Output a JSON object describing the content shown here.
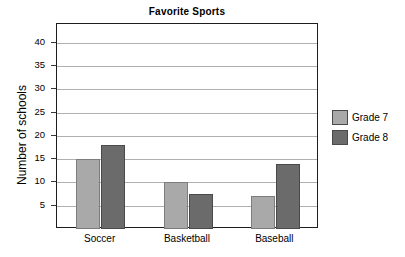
{
  "chart_data": {
    "type": "bar",
    "title": "Favorite Sports",
    "xlabel": "",
    "ylabel": "Number of schools",
    "categories": [
      "Soccer",
      "Basketball",
      "Baseball"
    ],
    "series": [
      {
        "name": "Grade 7",
        "color": "#a9a9a9",
        "values": [
          15,
          10,
          7
        ]
      },
      {
        "name": "Grade 8",
        "color": "#6b6b6b",
        "values": [
          18,
          7.5,
          14
        ]
      }
    ],
    "ylim": [
      0,
      44
    ],
    "yticks": [
      5,
      10,
      15,
      20,
      25,
      30,
      35,
      40
    ],
    "ytick_labels": [
      "5",
      "10",
      "15",
      "20",
      "25",
      "30",
      "35",
      "40"
    ],
    "grid": "horizontal",
    "legend_position": "right"
  },
  "legend": {
    "items": [
      {
        "label": "Grade 7",
        "swatch": "legend-swatch-grade-7"
      },
      {
        "label": "Grade 8",
        "swatch": "legend-swatch-grade-8"
      }
    ]
  }
}
